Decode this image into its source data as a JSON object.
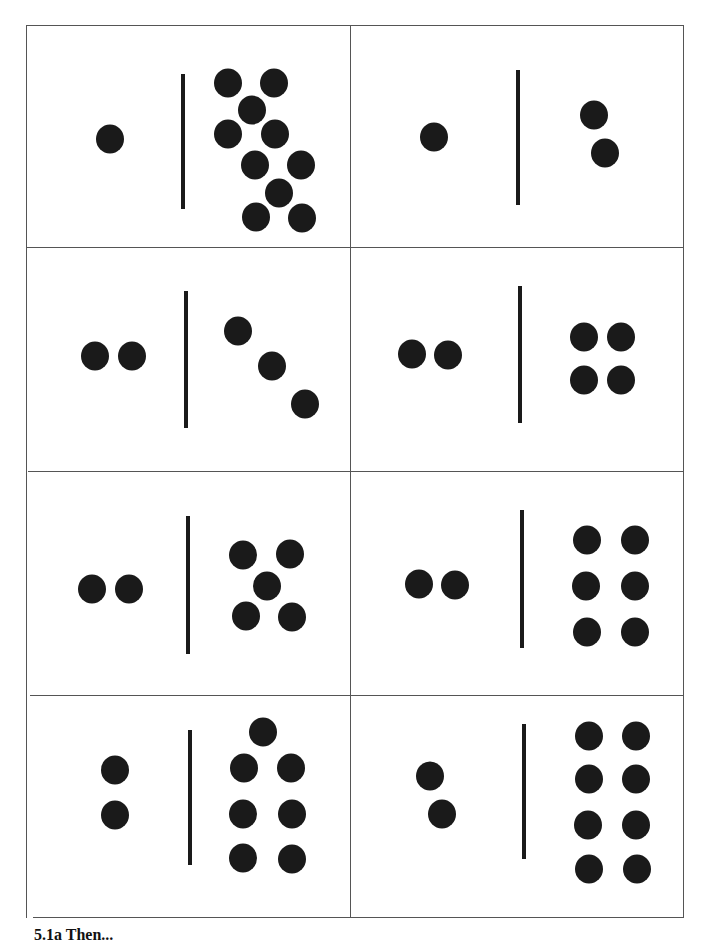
{
  "worksheet": {
    "title": "Dot comparison cards",
    "grid": {
      "rows": 4,
      "cols": 2,
      "line_color": "#555555",
      "dot_color": "#1a1a1a"
    },
    "cards": [
      {
        "left_count": 1,
        "right_count": 10,
        "left": [
          [
            110,
            139
          ]
        ],
        "line": [
          183,
          74,
          209
        ],
        "right": [
          [
            228,
            83
          ],
          [
            274,
            83
          ],
          [
            252,
            110
          ],
          [
            228,
            134
          ],
          [
            275,
            134
          ],
          [
            255,
            165
          ],
          [
            301,
            165
          ],
          [
            279,
            193
          ],
          [
            256,
            217
          ],
          [
            302,
            218
          ]
        ]
      },
      {
        "left_count": 1,
        "right_count": 2,
        "left": [
          [
            434,
            137
          ]
        ],
        "line": [
          518,
          70,
          205
        ],
        "right": [
          [
            594,
            115
          ],
          [
            605,
            153
          ]
        ]
      },
      {
        "left_count": 2,
        "right_count": 3,
        "left": [
          [
            95,
            356
          ],
          [
            132,
            356
          ]
        ],
        "line": [
          186,
          291,
          428
        ],
        "right": [
          [
            238,
            331
          ],
          [
            272,
            366
          ],
          [
            305,
            404
          ]
        ]
      },
      {
        "left_count": 2,
        "right_count": 4,
        "left": [
          [
            412,
            354
          ],
          [
            448,
            355
          ]
        ],
        "line": [
          520,
          286,
          423
        ],
        "right": [
          [
            584,
            337
          ],
          [
            621,
            337
          ],
          [
            584,
            380
          ],
          [
            621,
            380
          ]
        ]
      },
      {
        "left_count": 2,
        "right_count": 5,
        "left": [
          [
            92,
            589
          ],
          [
            129,
            589
          ]
        ],
        "line": [
          188,
          516,
          654
        ],
        "right": [
          [
            243,
            555
          ],
          [
            290,
            554
          ],
          [
            267,
            586
          ],
          [
            246,
            616
          ],
          [
            292,
            617
          ]
        ]
      },
      {
        "left_count": 2,
        "right_count": 6,
        "left": [
          [
            419,
            584
          ],
          [
            455,
            585
          ]
        ],
        "line": [
          522,
          510,
          648
        ],
        "right": [
          [
            587,
            540
          ],
          [
            635,
            540
          ],
          [
            586,
            586
          ],
          [
            635,
            586
          ],
          [
            587,
            632
          ],
          [
            635,
            632
          ]
        ]
      },
      {
        "left_count": 2,
        "right_count": 7,
        "left": [
          [
            115,
            770
          ],
          [
            115,
            815
          ]
        ],
        "line": [
          190,
          730,
          865
        ],
        "right": [
          [
            263,
            732
          ],
          [
            244,
            768
          ],
          [
            291,
            768
          ],
          [
            243,
            814
          ],
          [
            292,
            814
          ],
          [
            243,
            858
          ],
          [
            292,
            859
          ]
        ]
      },
      {
        "left_count": 2,
        "right_count": 8,
        "left": [
          [
            430,
            776
          ],
          [
            442,
            814
          ]
        ],
        "line": [
          524,
          724,
          859
        ],
        "right": [
          [
            589,
            736
          ],
          [
            636,
            736
          ],
          [
            589,
            779
          ],
          [
            636,
            779
          ],
          [
            588,
            825
          ],
          [
            636,
            825
          ],
          [
            589,
            869
          ],
          [
            637,
            869
          ]
        ]
      }
    ],
    "footer_caption": "5.1a  Then..."
  }
}
